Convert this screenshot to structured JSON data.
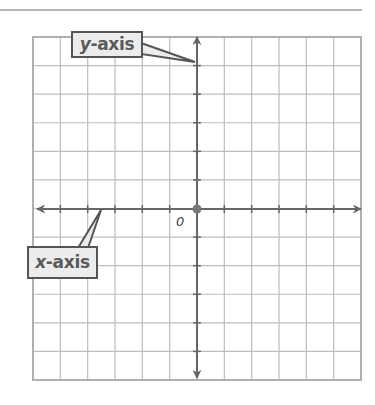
{
  "diagram": {
    "type": "coordinate-plane",
    "grid": {
      "columns": 12,
      "rows": 12,
      "left": 33,
      "top": 37,
      "right": 361,
      "bottom": 380,
      "line_color": "#bdbdbd",
      "border_color": "#b0b0b0"
    },
    "axes": {
      "color": "#666666",
      "origin": {
        "x": 197,
        "y": 209
      },
      "origin_dot_color": "#777777",
      "x_axis": {
        "label_var": "x",
        "label_rest": "-axis",
        "arrow_left": 37,
        "arrow_right": 361
      },
      "y_axis": {
        "label_var": "y",
        "label_rest": "-axis",
        "arrow_top": 37,
        "arrow_bottom": 378
      }
    },
    "origin_label": "0",
    "callouts": {
      "y_axis": {
        "box_color": "#ececec",
        "border_color": "#555555",
        "pointer_to": {
          "x": 195,
          "y": 62
        }
      },
      "x_axis": {
        "box_color": "#ececec",
        "border_color": "#555555",
        "pointer_to": {
          "x": 101,
          "y": 210
        }
      }
    },
    "top_rule": {
      "y": 10,
      "color": "#9a9a9a"
    }
  }
}
